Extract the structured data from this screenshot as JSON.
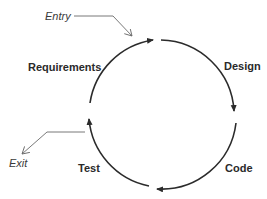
{
  "diagram": {
    "title": "",
    "stages": [
      {
        "label": "Requirements"
      },
      {
        "label": "Design"
      },
      {
        "label": "Code"
      },
      {
        "label": "Test"
      }
    ],
    "entry_label": "Entry",
    "exit_label": "Exit",
    "colors": {
      "arc": "#2b2b2b",
      "pointer": "#6a6a6a",
      "text": "#2a2a2a"
    }
  }
}
